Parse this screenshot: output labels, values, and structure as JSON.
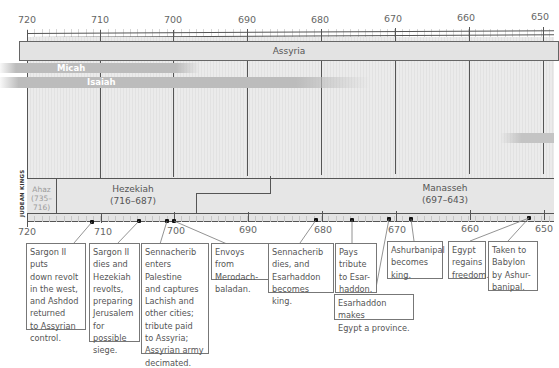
{
  "top_axis": {
    "ticks": [
      {
        "label": "720",
        "x": 27
      },
      {
        "label": "710",
        "x": 100
      },
      {
        "label": "700",
        "x": 173
      },
      {
        "label": "690",
        "x": 247
      },
      {
        "label": "680",
        "x": 320
      },
      {
        "label": "670",
        "x": 393
      },
      {
        "label": "660",
        "x": 466
      },
      {
        "label": "650",
        "x": 540
      }
    ]
  },
  "bottom_axis": {
    "ticks": [
      {
        "label": "720",
        "x": 27
      },
      {
        "label": "710",
        "x": 101
      },
      {
        "label": "700",
        "x": 174
      },
      {
        "label": "690",
        "x": 248
      },
      {
        "label": "680",
        "x": 322
      },
      {
        "label": "670",
        "x": 396
      },
      {
        "label": "660",
        "x": 470
      },
      {
        "label": "650",
        "x": 544
      }
    ]
  },
  "empires": {
    "assyria": "Assyria"
  },
  "prophets": [
    {
      "name": "Micah",
      "start_year": 720,
      "end_year": 697
    },
    {
      "name": "Isaiah",
      "start_year": 720,
      "end_year": 681
    }
  ],
  "kings_section_label": "JUDEAN KINGS",
  "kings": [
    {
      "name": "Ahaz",
      "dates": "(735–716)"
    },
    {
      "name": "Hezekiah",
      "dates": "(716–687)"
    },
    {
      "name": "Manasseh",
      "dates": "(697–643)"
    }
  ],
  "events": [
    {
      "id": "e1",
      "text": "Sargon II puts\ndown revolt\nin the west,\nand Ashdod\nreturned\nto Assyrian\ncontrol."
    },
    {
      "id": "e2",
      "text": "Sargon II\ndies and\nHezekiah\nrevolts,\npreparing\nJerusalem\nfor possible\nsiege."
    },
    {
      "id": "e3",
      "text": "Sennacherib\nenters Palestine\nand captures\nLachish and\nother cities;\ntribute paid\nto Assyria;\nAssyrian army\ndecimated."
    },
    {
      "id": "e4",
      "text": "Envoys from\nMerodach-\nbaladan."
    },
    {
      "id": "e5",
      "text": "Sennacherib\ndies, and\nEsarhaddon\nbecomes king."
    },
    {
      "id": "e6",
      "text": "Pays\ntribute\nto Esar-\nhaddon."
    },
    {
      "id": "e7",
      "text": "Esarhaddon makes\nEgypt a province."
    },
    {
      "id": "e8",
      "text": "Ashurbanipal\nbecomes\nking."
    },
    {
      "id": "e9",
      "text": "Egypt\nregains\nfreedom."
    },
    {
      "id": "e10",
      "text": "Taken to\nBabylon\nby Ashur-\nbanipal."
    }
  ],
  "colors": {
    "grid_bg": "#e8e8e8",
    "bar_band": "#e3e3e3",
    "prophet_bar": "#bdbdbd",
    "axis": "#555555",
    "text": "#555555"
  }
}
